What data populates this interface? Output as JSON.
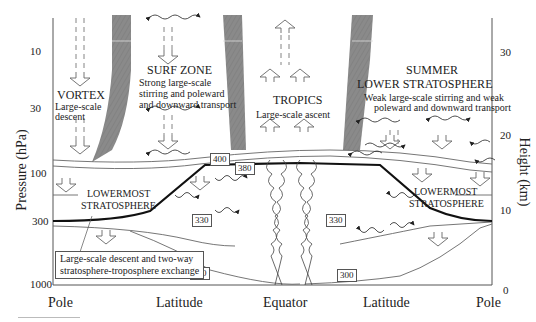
{
  "y_axis_left": {
    "title": "Pressure (hPa)",
    "ticks": [
      "10",
      "30",
      "100",
      "300",
      "1000"
    ]
  },
  "y_axis_right": {
    "title": "Height (km)",
    "ticks": [
      "30",
      "20",
      "10",
      "0"
    ]
  },
  "x_axis": {
    "categories": [
      "Pole",
      "Latitude",
      "Equator",
      "Latitude",
      "Pole"
    ]
  },
  "regions": {
    "vortex": {
      "title": "VORTEX",
      "desc": [
        "Large-scale",
        "descent"
      ]
    },
    "surf_zone": {
      "title": "SURF ZONE",
      "desc": [
        "Strong large-scale",
        "stirring  and poleward",
        "and downward transport"
      ]
    },
    "tropics": {
      "title": "TROPICS",
      "desc": "Large-scale ascent"
    },
    "summer": {
      "title_1": "SUMMER",
      "title_2": "LOWER STRATOSPHERE",
      "desc": [
        "Weak large-scale stirring  and weak",
        "poleward and downward transport"
      ]
    },
    "lowermost_left": {
      "line1": "LOWERMOST",
      "line2": "STRATOSPHERE"
    },
    "lowermost_right": {
      "line1": "LOWERMOST",
      "line2": "STRATOSPHERE"
    }
  },
  "isentropes": {
    "k400": "400",
    "k380": "380",
    "k330_left": "330",
    "k330_right": "330",
    "k300_left": "300",
    "k300_right": "300"
  },
  "note": {
    "line1": "Large-scale descent and two-way",
    "line2": "stratosphere-troposphere exchange"
  },
  "colors": {
    "barrier_band": "#8a8a8a",
    "tropopause": "#111111",
    "lines": "#666666"
  }
}
